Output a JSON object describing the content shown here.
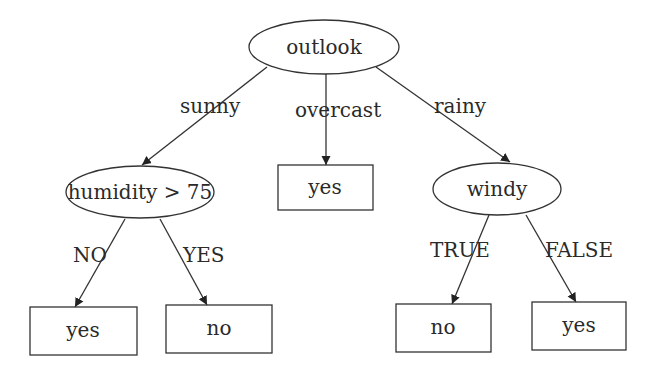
{
  "diagram": {
    "type": "decision-tree",
    "root": {
      "label": "outlook",
      "shape": "ellipse"
    },
    "internal_nodes": {
      "humidity": {
        "label": "humidity > 75",
        "shape": "ellipse"
      },
      "windy": {
        "label": "windy",
        "shape": "ellipse"
      }
    },
    "leaves": {
      "overcast_leaf": {
        "label": "yes",
        "shape": "box"
      },
      "humidity_no_leaf": {
        "label": "yes",
        "shape": "box"
      },
      "humidity_yes_leaf": {
        "label": "no",
        "shape": "box"
      },
      "windy_true_leaf": {
        "label": "no",
        "shape": "box"
      },
      "windy_false_leaf": {
        "label": "yes",
        "shape": "box"
      }
    },
    "edges": {
      "sunny": {
        "label": "sunny",
        "from": "outlook",
        "to": "humidity > 75"
      },
      "overcast": {
        "label": "overcast",
        "from": "outlook",
        "to": "yes"
      },
      "rainy": {
        "label": "rainy",
        "from": "outlook",
        "to": "windy"
      },
      "humidity_no": {
        "label": "NO",
        "from": "humidity > 75",
        "to": "yes"
      },
      "humidity_yes": {
        "label": "YES",
        "from": "humidity > 75",
        "to": "no"
      },
      "windy_true": {
        "label": "TRUE",
        "from": "windy",
        "to": "no"
      },
      "windy_false": {
        "label": "FALSE",
        "from": "windy",
        "to": "yes"
      }
    },
    "colors": {
      "stroke": "#333333",
      "text": "#2a2a2a",
      "background": "#ffffff"
    }
  }
}
